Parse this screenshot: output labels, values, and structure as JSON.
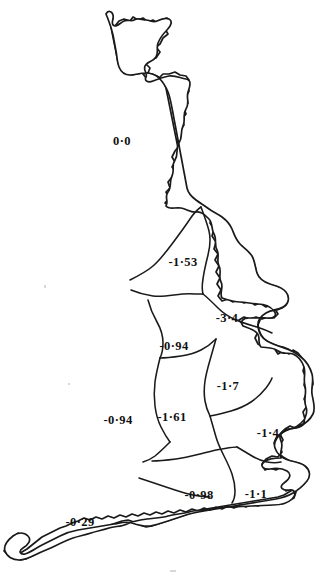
{
  "figure": {
    "name": "great-britain-regional-value-map",
    "type": "choropleth-outline-map",
    "background_color": "#ffffff",
    "line_color": "#1a1a1a",
    "text_color": "#101010",
    "decimal_separator": "·"
  },
  "regions": [
    {
      "id": "scotland",
      "label": "0·0",
      "value": 0.0,
      "x": 122,
      "y": 141
    },
    {
      "id": "north-england",
      "label": "-1·53",
      "value": -1.53,
      "x": 183,
      "y": 262
    },
    {
      "id": "yorkshire-humberside",
      "label": "-3·4",
      "value": -3.4,
      "x": 227,
      "y": 318
    },
    {
      "id": "north-west-midlands",
      "label": "-0·94",
      "value": -0.94,
      "x": 174,
      "y": 346
    },
    {
      "id": "east-midlands",
      "label": "-1·7",
      "value": -1.7,
      "x": 228,
      "y": 386
    },
    {
      "id": "wales",
      "label": "-0·94",
      "value": -0.94,
      "x": 118,
      "y": 420
    },
    {
      "id": "west-midlands-south-west",
      "label": "-1·61",
      "value": -1.61,
      "x": 172,
      "y": 417
    },
    {
      "id": "east-anglia",
      "label": "-1·4",
      "value": -1.4,
      "x": 268,
      "y": 433
    },
    {
      "id": "southern",
      "label": "-0·98",
      "value": -0.98,
      "x": 199,
      "y": 495
    },
    {
      "id": "south-east",
      "label": "-1·1",
      "value": -1.1,
      "x": 256,
      "y": 494
    },
    {
      "id": "south-west",
      "label": "-0·29",
      "value": -0.29,
      "x": 80,
      "y": 522
    }
  ]
}
